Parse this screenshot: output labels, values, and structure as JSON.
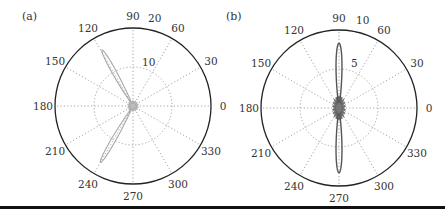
{
  "chart_data": [
    {
      "type": "polar",
      "panel_label": "(a)",
      "title": "",
      "angular_ticks_deg": [
        0,
        30,
        60,
        90,
        120,
        150,
        180,
        210,
        240,
        270,
        300,
        330
      ],
      "angular_tick_labels": [
        "0",
        "30",
        "60",
        "90",
        "120",
        "150",
        "180",
        "210",
        "240",
        "270",
        "300",
        "330"
      ],
      "radial_ticks": [
        10,
        20
      ],
      "radial_tick_labels": [
        "10",
        "20"
      ],
      "rlim": [
        0,
        20
      ],
      "grid": true,
      "series": [
        {
          "name": "pattern",
          "color": "#a8a8a8",
          "description": "Two narrow lobes, one toward ~120° and one toward ~240°, small clutter near origin",
          "lobes": [
            {
              "angle_deg": 119,
              "peak_r": 16.4,
              "width_deg": 6
            },
            {
              "angle_deg": 240,
              "peak_r": 16.7,
              "width_deg": 6
            }
          ]
        }
      ]
    },
    {
      "type": "polar",
      "panel_label": "(b)",
      "title": "",
      "angular_ticks_deg": [
        0,
        30,
        60,
        90,
        120,
        150,
        180,
        210,
        240,
        270,
        300,
        330
      ],
      "angular_tick_labels": [
        "0",
        "30",
        "60",
        "90",
        "120",
        "150",
        "180",
        "210",
        "240",
        "270",
        "300",
        "330"
      ],
      "radial_ticks": [
        5,
        10
      ],
      "radial_tick_labels": [
        "5",
        "10"
      ],
      "rlim": [
        0,
        10
      ],
      "grid": true,
      "series": [
        {
          "name": "pattern",
          "color": "#555555",
          "description": "Two narrow lobes at 90° and 270°, dense small side lobes near origin",
          "lobes": [
            {
              "angle_deg": 90,
              "peak_r": 8.3,
              "width_deg": 8
            },
            {
              "angle_deg": 270,
              "peak_r": 8.3,
              "width_deg": 8
            }
          ]
        }
      ]
    }
  ],
  "panels": {
    "a": {
      "label": "(a)",
      "rmax_label": "20",
      "rmid_label": "10"
    },
    "b": {
      "label": "(b)",
      "rmax_label": "10",
      "rmid_label": "5"
    }
  }
}
